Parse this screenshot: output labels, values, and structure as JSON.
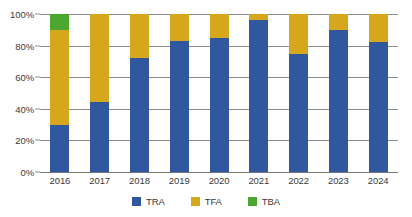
{
  "chart_data": {
    "type": "bar",
    "title": "",
    "subtitle": "",
    "xlabel": "",
    "ylabel": "",
    "stacked": true,
    "stack_total": 100,
    "grid": true,
    "legend_position": "bottom",
    "ylim": [
      0,
      100
    ],
    "ytick_labels": [
      "0%",
      "20%",
      "40%",
      "60%",
      "80%",
      "100%"
    ],
    "ytick_values": [
      0,
      20,
      40,
      60,
      80,
      100
    ],
    "categories": [
      "2016",
      "2017",
      "2018",
      "2019",
      "2020",
      "2021",
      "2022",
      "2023",
      "2024"
    ],
    "series": [
      {
        "name": "TRA",
        "color": "#31589E",
        "values": [
          30,
          44,
          72,
          83,
          85,
          96,
          75,
          90,
          82
        ]
      },
      {
        "name": "TFA",
        "color": "#D6A61C",
        "values": [
          60,
          56,
          28,
          17,
          15,
          4,
          25,
          10,
          18
        ]
      },
      {
        "name": "TBA",
        "color": "#4BA730",
        "values": [
          10,
          0,
          0,
          0,
          0,
          0,
          0,
          0,
          0
        ]
      }
    ]
  }
}
